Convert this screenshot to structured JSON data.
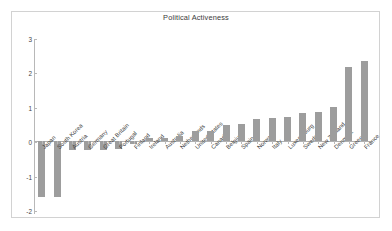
{
  "chart_data": {
    "type": "bar",
    "title": "Political Activeness",
    "xlabel": "",
    "ylabel": "",
    "ylim": [
      -2,
      3
    ],
    "yticks": [
      3,
      2,
      1,
      0,
      -1,
      -2
    ],
    "ytick_labels": [
      "3",
      "2",
      "1",
      "0",
      "-1",
      "-2"
    ],
    "grid": false,
    "legend": null,
    "bar_color": "#9d9d9d",
    "categories": [
      "Japan",
      "South Korea",
      "Austria",
      "Germany",
      "Great Britain",
      "Portugal",
      "Finland",
      "Ireland",
      "Australia",
      "Netherlands",
      "United States",
      "Canada",
      "Belgium",
      "Spain",
      "Norway",
      "Italy",
      "Luxembourg",
      "Sweden",
      "New Zealand",
      "Denmark",
      "Greece",
      "France"
    ],
    "values": [
      -1.6,
      -1.6,
      -0.22,
      -0.24,
      -0.22,
      -0.2,
      -0.04,
      0.12,
      0.11,
      0.18,
      0.32,
      0.34,
      0.5,
      0.54,
      0.68,
      0.69,
      0.73,
      0.84,
      0.87,
      1.02,
      2.2,
      2.35
    ]
  },
  "figure": {
    "background_color": "#ffffff",
    "frame_color": "#d2d2d2",
    "axis_color": "#b8b8b8"
  }
}
